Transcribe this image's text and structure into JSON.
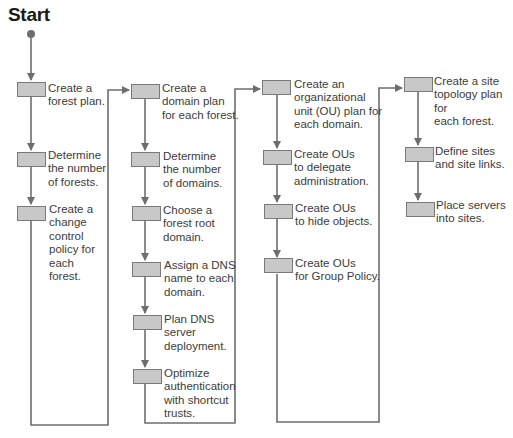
{
  "diagram": {
    "title": "Start",
    "colors": {
      "line": "#6e6e6e",
      "box_fill": "#c8c8c8",
      "box_border": "#7a7a7a",
      "text": "#3c3c3c",
      "title": "#1a1a1a"
    },
    "columns": [
      {
        "name": "forest",
        "steps": [
          {
            "label": "Create a\nforest plan."
          },
          {
            "label": "Determine\nthe number\nof forests."
          },
          {
            "label": "Create a\nchange\ncontrol\npolicy for\neach\nforest."
          }
        ]
      },
      {
        "name": "domain",
        "steps": [
          {
            "label": "Create a\ndomain plan\nfor each forest."
          },
          {
            "label": "Determine\nthe number\nof domains."
          },
          {
            "label": "Choose a\nforest root\ndomain."
          },
          {
            "label": "Assign a DNS\nname to each\ndomain."
          },
          {
            "label": "Plan DNS\nserver\ndeployment."
          },
          {
            "label": "Optimize\nauthentication\nwith shortcut\ntrusts."
          }
        ]
      },
      {
        "name": "ou",
        "steps": [
          {
            "label": "Create an\norganizational\nunit (OU) plan for\neach domain."
          },
          {
            "label": "Create OUs\nto delegate\nadministration."
          },
          {
            "label": "Create OUs\nto hide objects."
          },
          {
            "label": "Create OUs\nfor Group Policy."
          }
        ]
      },
      {
        "name": "site",
        "steps": [
          {
            "label": "Create a site\ntopology plan for\neach forest."
          },
          {
            "label": "Define sites\nand site links."
          },
          {
            "label": "Place servers\ninto sites."
          }
        ]
      }
    ]
  }
}
